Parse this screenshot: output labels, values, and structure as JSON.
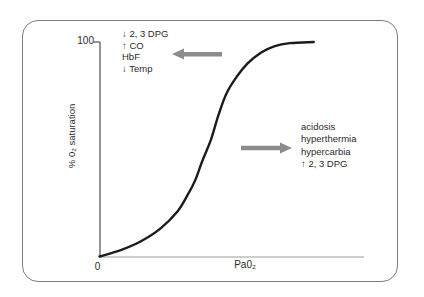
{
  "colors": {
    "curve": "#1c1c1c",
    "arrow": "#8c8c8c",
    "y_axis": "#4d4d4d",
    "x_axis": "#9a9a9a",
    "frame_border": "#7d7d7d",
    "text": "#2b2b2b"
  },
  "axes": {
    "y_label": "% 0₂ saturation",
    "y_tick_top": "100",
    "origin_label": "0",
    "x_label": "Pa0₂"
  },
  "annotations": {
    "left_shift": {
      "lines": [
        "↓ 2, 3 DPG",
        "↑ CO",
        "HbF",
        "↓ Temp"
      ]
    },
    "right_shift": {
      "lines": [
        "acidosis",
        "hyperthermia",
        "hypercarbia",
        "↑ 2, 3 DPG"
      ]
    }
  },
  "chart_data": {
    "type": "line",
    "title": "",
    "xlabel": "Pa0₂",
    "ylabel": "% 0₂ saturation",
    "xlim": [
      0,
      100
    ],
    "ylim": [
      0,
      100
    ],
    "x_tick_labels": [
      "0"
    ],
    "y_tick_labels": [
      "100"
    ],
    "grid": false,
    "legend": false,
    "series": [
      {
        "name": "oxyhemoglobin-dissociation-curve",
        "points": [
          [
            0,
            0
          ],
          [
            8,
            3
          ],
          [
            15.5,
            7
          ],
          [
            23,
            13
          ],
          [
            29.5,
            21
          ],
          [
            33,
            28
          ],
          [
            36,
            35
          ],
          [
            39,
            45
          ],
          [
            42,
            54
          ],
          [
            45,
            66
          ],
          [
            48,
            76
          ],
          [
            52,
            84
          ],
          [
            56,
            90
          ],
          [
            61,
            95
          ],
          [
            66,
            98
          ],
          [
            72,
            99.5
          ],
          [
            81,
            100
          ]
        ]
      }
    ],
    "annotations": [
      {
        "text": "↓ 2, 3 DPG | ↑ CO | HbF | ↓ Temp",
        "arrow": "left",
        "position": "upper-left"
      },
      {
        "text": "acidosis | hyperthermia | hypercarbia | ↑ 2, 3 DPG",
        "arrow": "right",
        "position": "middle-right"
      }
    ]
  }
}
